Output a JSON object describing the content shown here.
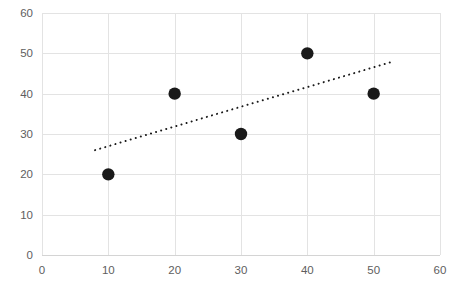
{
  "chart_data": {
    "type": "scatter",
    "title": "",
    "subtitle": "",
    "xlabel": "",
    "ylabel": "",
    "xlim": [
      0,
      60
    ],
    "ylim": [
      0,
      60
    ],
    "xticks": [
      0,
      10,
      20,
      30,
      40,
      50,
      60
    ],
    "yticks": [
      0,
      10,
      20,
      30,
      40,
      50,
      60
    ],
    "xtick_labels": [
      "0",
      "10",
      "20",
      "30",
      "40",
      "50",
      "60"
    ],
    "ytick_labels": [
      "0",
      "10",
      "20",
      "30",
      "40",
      "50",
      "60"
    ],
    "grid": true,
    "legend": false,
    "legend_position": "none",
    "series": [
      {
        "name": "data-points",
        "type": "scatter",
        "marker": "filled-circle",
        "color": "#1a1a1a",
        "points": [
          {
            "x": 10,
            "y": 20
          },
          {
            "x": 20,
            "y": 40
          },
          {
            "x": 30,
            "y": 30
          },
          {
            "x": 40,
            "y": 50
          },
          {
            "x": 50,
            "y": 40
          }
        ]
      },
      {
        "name": "trendline",
        "type": "line",
        "style": "dotted",
        "color": "#1a1a1a",
        "x_start": 8,
        "y_start": 26,
        "x_end": 53,
        "y_end": 48
      }
    ],
    "annotations": []
  },
  "colors": {
    "marker": "#1a1a1a",
    "trendline": "#1a1a1a",
    "gridline": "#e3e3e3",
    "axisline": "#d4d4d4",
    "tick_label": "#5e5e5e",
    "background": "#ffffff"
  }
}
